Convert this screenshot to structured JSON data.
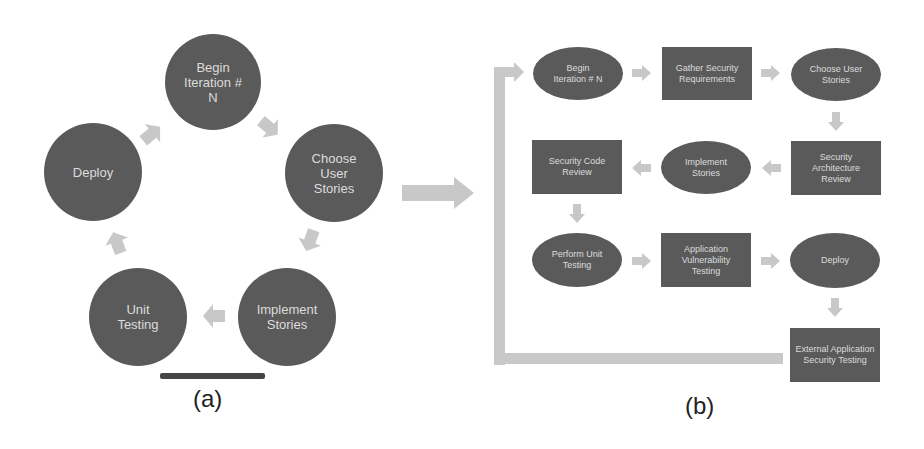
{
  "panel_a": {
    "caption": "(a)",
    "nodes": [
      {
        "id": "begin",
        "label": "Begin Iteration # N"
      },
      {
        "id": "choose",
        "label": "Choose User Stories"
      },
      {
        "id": "implement",
        "label": "Implement Stories"
      },
      {
        "id": "unit",
        "label": "Unit Testing"
      },
      {
        "id": "deploy",
        "label": "Deploy"
      }
    ]
  },
  "panel_b": {
    "caption": "(b)",
    "nodes": [
      {
        "id": "begin",
        "label": "Begin Iteration # N",
        "shape": "oval"
      },
      {
        "id": "gather",
        "label": "Gather Security Requirements",
        "shape": "rect"
      },
      {
        "id": "choose",
        "label": "Choose User Stories",
        "shape": "oval"
      },
      {
        "id": "arch",
        "label": "Security Architecture Review",
        "shape": "rect"
      },
      {
        "id": "implement",
        "label": "Implement Stories",
        "shape": "oval"
      },
      {
        "id": "codereview",
        "label": "Security Code Review",
        "shape": "rect"
      },
      {
        "id": "unit",
        "label": "Perform Unit Testing",
        "shape": "oval"
      },
      {
        "id": "vuln",
        "label": "Application Vulnerability Testing",
        "shape": "rect"
      },
      {
        "id": "deploy",
        "label": "Deploy",
        "shape": "oval"
      },
      {
        "id": "external",
        "label": "External Application Security Testing",
        "shape": "rect"
      }
    ]
  },
  "colors": {
    "node": "#5a5a5a",
    "text": "#dcdcdc",
    "arrow": "#c8c8c8"
  }
}
